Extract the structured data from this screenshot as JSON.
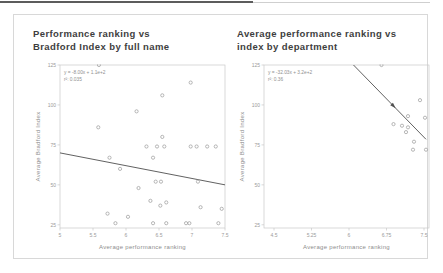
{
  "window": {
    "top_edge_color": "#5c5c5c"
  },
  "chart_data": [
    {
      "type": "scatter",
      "title_lines": [
        "Performance ranking vs",
        "Bradford Index by full name"
      ],
      "xlabel": "Average performance ranking",
      "ylabel": "Average Bradford Index",
      "annotation_lines": [
        "y = -8.00x + 1.1e+2",
        "r²: 0.035"
      ],
      "xlim": [
        5.0,
        7.5
      ],
      "ylim": [
        23,
        125
      ],
      "xticks": {
        "values": [
          5,
          5.5,
          6,
          6.5,
          7,
          7.5
        ],
        "labels": [
          "5",
          "5.5",
          "6",
          "6.5",
          "7",
          "7.5"
        ]
      },
      "yticks": {
        "values": [
          125,
          100,
          75,
          50,
          25
        ],
        "labels": [
          "125",
          "100",
          "75",
          "50",
          "25"
        ]
      },
      "points": [
        [
          5.59,
          125
        ],
        [
          6.98,
          114
        ],
        [
          6.55,
          106
        ],
        [
          6.16,
          96
        ],
        [
          5.58,
          86
        ],
        [
          6.55,
          80
        ],
        [
          6.31,
          74
        ],
        [
          6.47,
          74
        ],
        [
          6.58,
          74
        ],
        [
          6.98,
          74
        ],
        [
          7.07,
          74
        ],
        [
          7.23,
          74
        ],
        [
          7.36,
          74
        ],
        [
          6.41,
          67
        ],
        [
          5.75,
          67
        ],
        [
          5.91,
          60
        ],
        [
          6.45,
          52
        ],
        [
          6.53,
          52
        ],
        [
          7.09,
          52
        ],
        [
          6.19,
          48
        ],
        [
          6.37,
          40
        ],
        [
          6.61,
          39
        ],
        [
          6.52,
          37
        ],
        [
          7.13,
          36
        ],
        [
          7.45,
          35
        ],
        [
          5.72,
          32
        ],
        [
          6.03,
          30
        ],
        [
          5.84,
          26
        ],
        [
          6.41,
          26
        ],
        [
          6.61,
          26
        ],
        [
          6.91,
          26
        ],
        [
          6.96,
          26
        ],
        [
          7.4,
          26
        ]
      ],
      "trendline": {
        "x1": 5.0,
        "y1": 70,
        "x2": 7.5,
        "y2": 50,
        "arrow": false
      },
      "legend": "none",
      "grid": false
    },
    {
      "type": "scatter",
      "title_lines": [
        "Average performance ranking vs",
        "index by department"
      ],
      "xlabel": "Average performance ranking",
      "ylabel": "Average Bradford Index",
      "annotation_lines": [
        "y = -32.03x + 3.2e+2",
        "r²: 0.36"
      ],
      "xlim": [
        4.3,
        7.6
      ],
      "ylim": [
        23,
        125
      ],
      "xticks": {
        "values": [
          4.5,
          5.25,
          6,
          6.75,
          7.5
        ],
        "labels": [
          "4.5",
          "5.25",
          "6",
          "6.75",
          "7.5"
        ]
      },
      "yticks": {
        "values": [
          125,
          100,
          75,
          50,
          25
        ],
        "labels": [
          "125",
          "100",
          "75",
          "50",
          "25"
        ]
      },
      "points": [
        [
          6.65,
          125
        ],
        [
          7.42,
          103
        ],
        [
          7.18,
          93
        ],
        [
          7.52,
          92
        ],
        [
          6.89,
          88
        ],
        [
          7.06,
          87
        ],
        [
          7.18,
          86
        ],
        [
          7.14,
          83
        ],
        [
          7.3,
          77
        ],
        [
          7.28,
          72
        ],
        [
          7.54,
          72
        ]
      ],
      "trendline": {
        "x1": 6.09,
        "y1": 125,
        "x2": 7.54,
        "y2": 78.5,
        "arrow": true
      },
      "legend": "none",
      "grid": false
    }
  ],
  "style": {
    "spine_color": "#c9c9c9",
    "tick_text_color": "#9b9b9b",
    "axis_label_color": "#8d8d8d",
    "marker_color": "#a3a3a3",
    "trendline_color": "#4f4f4f",
    "annotation_color": "#909090"
  }
}
